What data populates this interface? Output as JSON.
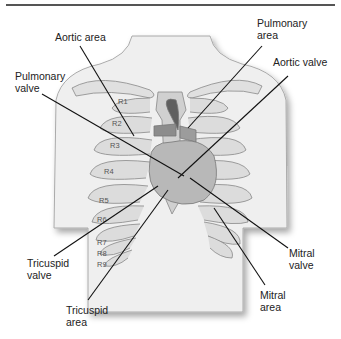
{
  "labels": {
    "aortic_area": "Aortic area",
    "pulmonary_area": "Pulmonary\narea",
    "pulmonary_valve": "Pulmonary\nvalve",
    "aortic_valve": "Aortic valve",
    "tricuspid_valve": "Tricuspid\nvalve",
    "tricuspid_area": "Tricuspid\narea",
    "mitral_valve": "Mitral\nvalve",
    "mitral_area": "Mitral\narea"
  },
  "ribs": [
    "R1",
    "R2",
    "R3",
    "R4",
    "R5",
    "R6",
    "R7",
    "R8",
    "R9"
  ],
  "colors": {
    "line": "#111111",
    "rib": "#d8d8d8",
    "heart": "#9a9a9a",
    "body": "#efefef"
  }
}
